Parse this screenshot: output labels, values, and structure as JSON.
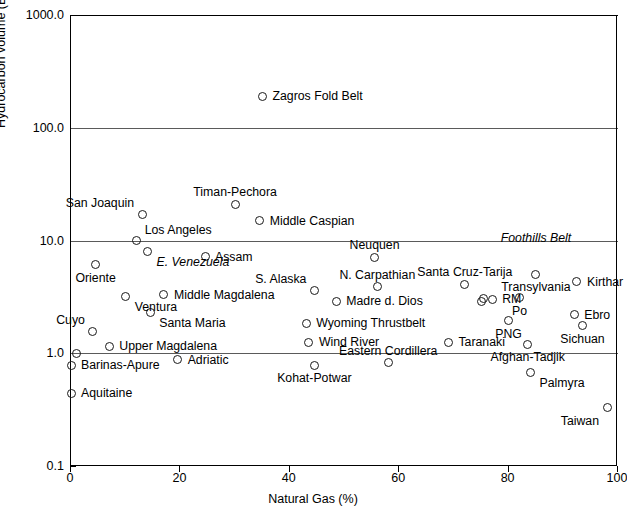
{
  "chart_data": {
    "type": "scatter",
    "title": "",
    "xlabel": "Natural Gas (%)",
    "ylabel": "Hydrocarbon volume (BBOE)",
    "xlim": [
      0,
      100
    ],
    "ylim": [
      0.1,
      1000.0
    ],
    "yscale": "log",
    "xscale": "linear",
    "grid": true,
    "grid_axis": "y",
    "legend": "none",
    "xticks": [
      "0",
      "20",
      "40",
      "60",
      "80",
      "100"
    ],
    "xtick_values": [
      0,
      20,
      40,
      60,
      80,
      100
    ],
    "yticks": [
      "1000.0",
      "100.0",
      "10.0",
      "1.0",
      "0.1"
    ],
    "ytick_values": [
      1000.0,
      100.0,
      10.0,
      1.0,
      0.1
    ],
    "points": [
      {
        "label": "Zagros Fold Belt",
        "x": 35,
        "y": 190,
        "label_pos": "right"
      },
      {
        "label": "San Joaquin",
        "x": 13,
        "y": 17,
        "label_pos": "upper-left"
      },
      {
        "label": "Timan-Pechora",
        "x": 30,
        "y": 21,
        "label_pos": "above"
      },
      {
        "label": "Middle Caspian",
        "x": 34.5,
        "y": 15,
        "label_pos": "right"
      },
      {
        "label": "Los Angeles",
        "x": 12,
        "y": 10.0,
        "label_pos": "upper-right"
      },
      {
        "label": "E. Venezuela",
        "x": 14,
        "y": 8.0,
        "label_pos": "below-right",
        "italic": true
      },
      {
        "label": "Oriente",
        "x": 4.5,
        "y": 6.1,
        "label_pos": "below"
      },
      {
        "label": "Foothills Belt",
        "x": 85,
        "y": 8.3,
        "label_pos": "above",
        "italic": true,
        "annotation": true
      },
      {
        "label": "Neuquen",
        "x": 55.5,
        "y": 7.1,
        "label_pos": "above"
      },
      {
        "label": "Transylvania",
        "x": 85,
        "y": 5.0,
        "label_pos": "below"
      },
      {
        "label": "Assam",
        "x": 24.5,
        "y": 7.2,
        "label_pos": "right"
      },
      {
        "label": "Santa Cruz-Tarija",
        "x": 72,
        "y": 4.1,
        "label_pos": "above"
      },
      {
        "label": "Kirthar",
        "x": 92.5,
        "y": 4.3,
        "label_pos": "right"
      },
      {
        "label": "Ventura",
        "x": 10,
        "y": 3.2,
        "label_pos": "below-right"
      },
      {
        "label": "S. Alaska",
        "x": 44.5,
        "y": 3.6,
        "label_pos": "upper-left"
      },
      {
        "label": "N. Carpathian",
        "x": 56,
        "y": 3.9,
        "label_pos": "above"
      },
      {
        "label": "Madre d. Dios",
        "x": 48.5,
        "y": 2.9,
        "label_pos": "right"
      },
      {
        "label": "RM",
        "x": 77,
        "y": 3.0,
        "label_pos": "right"
      },
      {
        "label": "Po",
        "x": 82,
        "y": 3.1,
        "label_pos": "below"
      },
      {
        "label": "Middle Magdalena",
        "x": 17,
        "y": 3.3,
        "label_pos": "right"
      },
      {
        "label": "Santa Maria",
        "x": 14.5,
        "y": 2.3,
        "label_pos": "below-right"
      },
      {
        "label": "Cuyo",
        "x": 4.0,
        "y": 1.55,
        "label_pos": "upper-left"
      },
      {
        "label": "Wyoming Thrustbelt",
        "x": 43,
        "y": 1.85,
        "label_pos": "right"
      },
      {
        "label": "Ebro",
        "x": 92,
        "y": 2.2,
        "label_pos": "right"
      },
      {
        "label": "PNG",
        "x": 80,
        "y": 1.95,
        "label_pos": "below"
      },
      {
        "label": "Sichuan",
        "x": 93.5,
        "y": 1.75,
        "label_pos": "below"
      },
      {
        "label": "Upper Magdalena",
        "x": 7.0,
        "y": 1.15,
        "label_pos": "right"
      },
      {
        "label": "Wind River",
        "x": 43.5,
        "y": 1.25,
        "label_pos": "right"
      },
      {
        "label": "Taranaki",
        "x": 69,
        "y": 1.25,
        "label_pos": "right"
      },
      {
        "label": "Afghan-Tadjik",
        "x": 83.5,
        "y": 1.2,
        "label_pos": "below"
      },
      {
        "label": "Barinas-Apure",
        "x": 0,
        "y": 0.78,
        "label_pos": "right"
      },
      {
        "label": "Adriatic",
        "x": 19.5,
        "y": 0.88,
        "label_pos": "right"
      },
      {
        "label": "Kohat-Potwar",
        "x": 44.5,
        "y": 0.78,
        "label_pos": "below"
      },
      {
        "label": "Eastern Cordillera",
        "x": 58,
        "y": 0.82,
        "label_pos": "above-only"
      },
      {
        "label": "Palmyra",
        "x": 84,
        "y": 0.68,
        "label_pos": "below-right"
      },
      {
        "label": "Aquitaine",
        "x": 0,
        "y": 0.44,
        "label_pos": "right"
      },
      {
        "label": "Taiwan",
        "x": 98,
        "y": 0.33,
        "label_pos": "below-left"
      }
    ],
    "extra_points": [
      {
        "x": 1.0,
        "y": 1.0
      },
      {
        "x": 75.5,
        "y": 3.05
      },
      {
        "x": 75.0,
        "y": 2.85
      }
    ]
  }
}
